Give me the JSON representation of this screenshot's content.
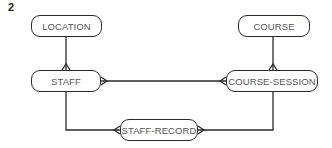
{
  "figure_number": "2",
  "diagram_type": "entity-relationship",
  "entities": [
    {
      "id": "location",
      "label": "LOCATION"
    },
    {
      "id": "course",
      "label": "COURSE"
    },
    {
      "id": "staff",
      "label": "STAFF"
    },
    {
      "id": "course_session",
      "label": "COURSE-SESSION"
    },
    {
      "id": "staff_record",
      "label": "STAFF-RECORD"
    }
  ],
  "relationships": [
    {
      "from": "LOCATION",
      "to": "STAFF",
      "cardinality": "one-to-many"
    },
    {
      "from": "COURSE",
      "to": "COURSE-SESSION",
      "cardinality": "one-to-many"
    },
    {
      "from": "STAFF",
      "to": "COURSE-SESSION",
      "cardinality": "many-to-many"
    },
    {
      "from": "STAFF",
      "to": "STAFF-RECORD",
      "cardinality": "one-to-many"
    },
    {
      "from": "COURSE-SESSION",
      "to": "STAFF-RECORD",
      "cardinality": "one-to-many"
    }
  ]
}
